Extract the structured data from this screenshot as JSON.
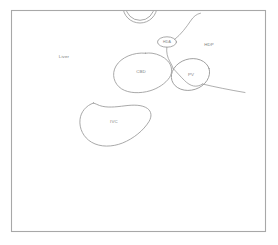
{
  "figure": {
    "type": "line-drawing",
    "background_color": "#ffffff",
    "line_color": "#9a9a9a",
    "frame_color": "#a8a8a8",
    "label_color": "#7d7d7d",
    "canvas": {
      "width": 278,
      "height": 245
    },
    "frame": {
      "x": 11,
      "y": 10,
      "width": 255,
      "height": 222
    }
  },
  "labels": {
    "liver": "Liver",
    "cbd": "CBD",
    "ivc": "IVC",
    "pv": "PV",
    "hda": "HDA",
    "hdp": "HDP"
  },
  "structures": [
    {
      "name": "liver",
      "label": "Liver",
      "shape": "background-region",
      "label_position": {
        "x": 64,
        "y": 57
      }
    },
    {
      "name": "common-bile-duct",
      "label": "CBD",
      "shape": "rounded-blob",
      "label_position": {
        "x": 141,
        "y": 72
      }
    },
    {
      "name": "inferior-vena-cava",
      "label": "IVC",
      "shape": "crescent-bean",
      "label_position": {
        "x": 114,
        "y": 122
      }
    },
    {
      "name": "portal-vein",
      "label": "PV",
      "shape": "oval",
      "label_position": {
        "x": 191,
        "y": 75
      }
    },
    {
      "name": "hepatic-duct-anterior",
      "label": "HDA",
      "shape": "small-ellipse",
      "label_position": {
        "x": 167,
        "y": 42
      }
    },
    {
      "name": "hepatic-duct-posterior",
      "label": "HDP",
      "shape": "label-only",
      "label_position": {
        "x": 209,
        "y": 45
      }
    },
    {
      "name": "aorta-cross-section",
      "label": "",
      "shape": "double-circle",
      "label_position": {
        "x": 140,
        "y": 12
      }
    }
  ]
}
